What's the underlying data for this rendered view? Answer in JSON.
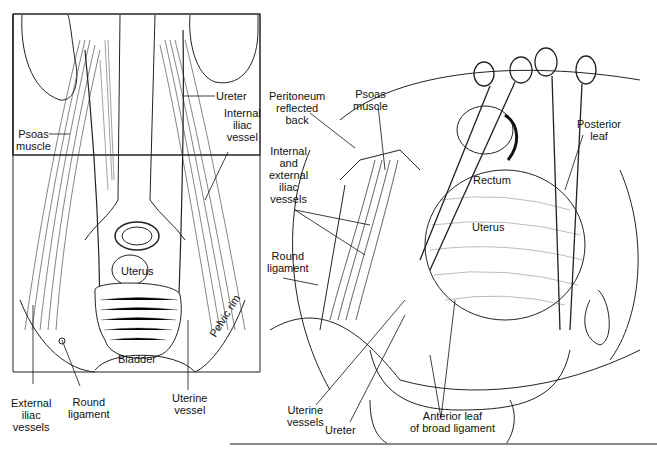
{
  "figure": {
    "left_panel": {
      "labels": {
        "ureter": "Ureter",
        "internal_iliac_vessel": "Internal\niliac\nvessel",
        "psoas_muscle": "Psoas\nmuscle",
        "uterus": "Uterus",
        "bladder": "Bladder",
        "pelvic_rim": "Pelvic rim",
        "external_iliac_vessels": "External\niliac\nvessels",
        "round_ligament": "Round\nligament",
        "uterine_vessel": "Uterine\nvessel"
      }
    },
    "right_panel": {
      "labels": {
        "peritoneum_reflected_back": "Peritoneum\nreflected\nback",
        "psoas_muscle": "Psoas\nmuscle",
        "internal_external_iliac_vessels": "Internal\nand\nexternal\niliac\nvessels",
        "round_ligament": "Round\nligament",
        "rectum": "Rectum",
        "uterus": "Uterus",
        "posterior_leaf": "Posterior\nleaf",
        "uterine_vessels": "Uterine\nvessels",
        "ureter": "Ureter",
        "anterior_leaf": "Anterior leaf\nof broad ligament"
      }
    },
    "colors": {
      "ink": "#111111",
      "background": "#ffffff",
      "rule": "#888888"
    }
  }
}
